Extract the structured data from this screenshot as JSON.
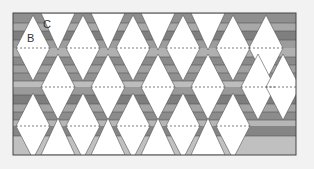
{
  "figure": {
    "title": "",
    "labels": [
      {
        "id": "B",
        "text": "B",
        "x": 27,
        "y": 32
      },
      {
        "id": "C",
        "text": "C",
        "x": 43,
        "y": 18
      }
    ],
    "colors": {
      "background": "#f2f2f2",
      "frame": "#555555",
      "white": "#ffffff",
      "dark": "#8a8a8a",
      "mid": "#a6a6a6",
      "light": "#c4c4c4",
      "dashed": "#555555"
    },
    "frame": {
      "x": 13,
      "y": 13,
      "width": 283,
      "height": 142
    },
    "diamond": {
      "half_width": 17,
      "half_height": 33
    },
    "rows": [
      {
        "cy": 48,
        "centers": [
          33,
          83,
          133,
          183,
          233,
          266
        ]
      },
      {
        "cy": 87,
        "centers": [
          58,
          108,
          158,
          208,
          258,
          283
        ]
      },
      {
        "cy": 126,
        "centers": [
          33,
          83,
          133,
          183,
          233
        ]
      }
    ],
    "top_triangles": [
      58,
      108,
      158,
      208
    ],
    "bottom_triangles": [
      58,
      108,
      158,
      208
    ]
  }
}
